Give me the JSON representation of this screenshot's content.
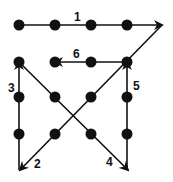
{
  "diagram": {
    "colors": {
      "ink": "#111111",
      "background": "#ffffff"
    },
    "dots": [
      {
        "x": 19,
        "y": 25
      },
      {
        "x": 55,
        "y": 25
      },
      {
        "x": 91,
        "y": 25
      },
      {
        "x": 127,
        "y": 25
      },
      {
        "x": 19,
        "y": 62
      },
      {
        "x": 55,
        "y": 62
      },
      {
        "x": 91,
        "y": 62
      },
      {
        "x": 127,
        "y": 62
      },
      {
        "x": 19,
        "y": 97
      },
      {
        "x": 55,
        "y": 97
      },
      {
        "x": 91,
        "y": 97
      },
      {
        "x": 127,
        "y": 97
      },
      {
        "x": 19,
        "y": 134
      },
      {
        "x": 55,
        "y": 134
      },
      {
        "x": 91,
        "y": 134
      },
      {
        "x": 127,
        "y": 134
      }
    ],
    "lines": [
      {
        "label": "1",
        "x1": 19,
        "y1": 25,
        "x2": 162,
        "y2": 25,
        "label_x": 74,
        "label_y": 21
      },
      {
        "label": "2",
        "x1": 162,
        "y1": 25,
        "x2": 20,
        "y2": 170,
        "label_x": 34,
        "label_y": 168
      },
      {
        "label": "3",
        "x1": 19,
        "y1": 170,
        "x2": 19,
        "y2": 62,
        "label_x": 8,
        "label_y": 92
      },
      {
        "label": "4",
        "x1": 19,
        "y1": 62,
        "x2": 128,
        "y2": 170,
        "label_x": 106,
        "label_y": 166
      },
      {
        "label": "5",
        "x1": 127,
        "y1": 170,
        "x2": 127,
        "y2": 62,
        "label_x": 133,
        "label_y": 90
      },
      {
        "label": "6",
        "x1": 127,
        "y1": 62,
        "x2": 55,
        "y2": 62,
        "label_x": 73,
        "label_y": 58
      }
    ]
  }
}
